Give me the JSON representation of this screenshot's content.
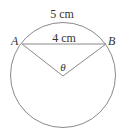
{
  "figure": {
    "arc_length_label": "5 cm",
    "chord_label": "4 cm",
    "point_a": "A",
    "point_b": "B",
    "angle_label": "θ",
    "stroke_color": "#8a8a8a",
    "text_color": "#333333"
  }
}
